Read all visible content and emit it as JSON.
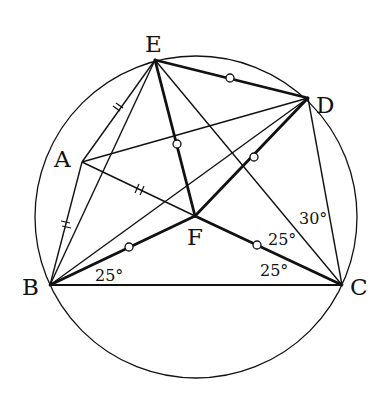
{
  "figure": {
    "type": "geometry-diagram"
  },
  "colors": {
    "background": "#ffffff",
    "stroke": "#111111"
  },
  "circle": {
    "cx": 196,
    "cy": 217,
    "r": 161
  },
  "points": {
    "E": {
      "label": "E",
      "x": 155,
      "y": 60
    },
    "D": {
      "label": "D",
      "x": 308,
      "y": 98
    },
    "A": {
      "label": "A",
      "x": 82,
      "y": 162
    },
    "F": {
      "label": "F",
      "x": 195,
      "y": 216
    },
    "B": {
      "label": "B",
      "x": 50,
      "y": 285
    },
    "C": {
      "label": "C",
      "x": 342,
      "y": 285
    }
  },
  "segments": {
    "thin": [
      [
        "E",
        "A"
      ],
      [
        "A",
        "B"
      ],
      [
        "A",
        "D"
      ],
      [
        "A",
        "F"
      ],
      [
        "E",
        "B"
      ],
      [
        "E",
        "C"
      ],
      [
        "B",
        "D"
      ],
      [
        "D",
        "C"
      ]
    ],
    "medium": [
      [
        "B",
        "C"
      ]
    ],
    "thick": [
      [
        "E",
        "D"
      ],
      [
        "E",
        "F"
      ],
      [
        "F",
        "D"
      ],
      [
        "B",
        "F"
      ],
      [
        "F",
        "C"
      ]
    ]
  },
  "markers": {
    "equal_circle_on": [
      [
        "E",
        "D"
      ],
      [
        "E",
        "F"
      ],
      [
        "F",
        "D"
      ],
      [
        "B",
        "F"
      ],
      [
        "F",
        "C"
      ]
    ],
    "double_tick_on": [
      [
        "E",
        "A"
      ],
      [
        "A",
        "B"
      ],
      [
        "A",
        "F"
      ]
    ]
  },
  "labels": {
    "E": "E",
    "D": "D",
    "A": "A",
    "F": "F",
    "B": "B",
    "C": "C"
  },
  "angles": {
    "FBC": "25°",
    "FCB": "25°",
    "ECF": "25°",
    "DCE": "30°"
  }
}
